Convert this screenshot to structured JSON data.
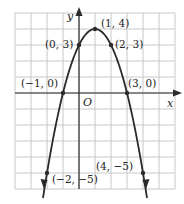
{
  "figure": {
    "type": "parabola_graph",
    "axes": {
      "x_label": "x",
      "y_label": "y",
      "origin_label": "O"
    },
    "grid": {
      "x_min": -4,
      "x_max": 6,
      "y_min": -6,
      "y_max": 5,
      "step": 1
    },
    "points": [
      {
        "x": -1,
        "y": 0,
        "label": "(−1, 0)"
      },
      {
        "x": 0,
        "y": 3,
        "label": "(0, 3)"
      },
      {
        "x": 1,
        "y": 4,
        "label": "(1, 4)"
      },
      {
        "x": 2,
        "y": 3,
        "label": "(2, 3)"
      },
      {
        "x": 3,
        "y": 0,
        "label": "(3, 0)"
      },
      {
        "x": -2,
        "y": -5,
        "label": "(−2, −5)"
      },
      {
        "x": 4,
        "y": -5,
        "label": "(4, −5)"
      }
    ],
    "curve": "y = -(x-1)^2 + 4",
    "colors": {
      "grid": "#c8c8c8",
      "curve": "#2a2a2a",
      "axis": "#2a2a2a"
    }
  }
}
